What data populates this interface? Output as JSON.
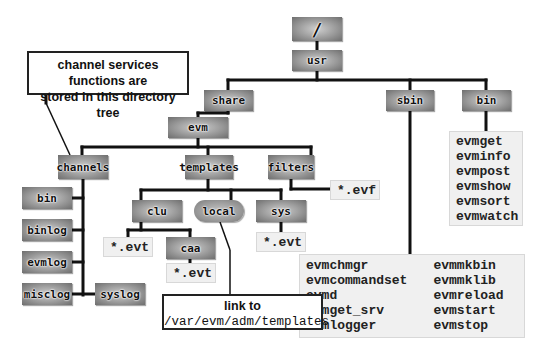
{
  "callouts": {
    "top": {
      "line1": "channel services functions are",
      "line2": "stored in this directory tree"
    },
    "link": {
      "line1": "link to",
      "line2": "/var/evm/adm/templates"
    }
  },
  "nodes": {
    "root": "/",
    "usr": "usr",
    "share": "share",
    "sbin": "sbin",
    "bin": "bin",
    "evm": "evm",
    "channels": "channels",
    "templates": "templates",
    "filters": "filters",
    "ch_bin": "bin",
    "binlog": "binlog",
    "evmlog": "evmlog",
    "misclog": "misclog",
    "syslog": "syslog",
    "clu": "clu",
    "local": "local",
    "sys": "sys",
    "caa": "caa"
  },
  "files": {
    "filters": "*.evf",
    "clu": "*.evt",
    "caa": "*.evt",
    "sys": "*.evt",
    "bin": [
      "evmget",
      "evminfo",
      "evmpost",
      "evmshow",
      "evmsort",
      "evmwatch"
    ],
    "sbin_col1": [
      "evmchmgr",
      "evmcommandset",
      "evmd",
      "evmget_srv",
      "evmlogger"
    ],
    "sbin_col2": [
      "evmmkbin",
      "evmmklib",
      "evmreload",
      "evmstart",
      "evmstop"
    ]
  }
}
